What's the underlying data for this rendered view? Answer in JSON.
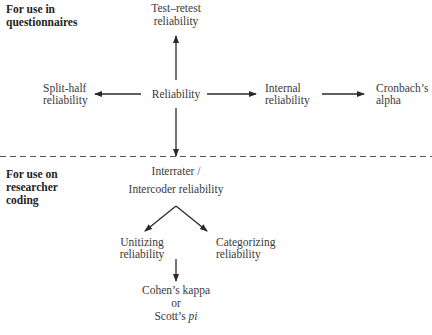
{
  "sections": {
    "top": {
      "line1": "For use in",
      "line2": "questionnaires"
    },
    "bottom": {
      "line1": "For use on",
      "line2": "researcher",
      "line3": "coding"
    }
  },
  "nodes": {
    "reliability": {
      "label": "Reliability"
    },
    "test_retest": {
      "line1": "Test–retest",
      "line2": "reliability"
    },
    "split_half": {
      "line1": "Split-half",
      "line2": "reliability"
    },
    "internal": {
      "line1": "Internal",
      "line2": "reliability"
    },
    "cronbach": {
      "line1": "Cronbach’s",
      "line2": "alpha"
    },
    "interrater": {
      "line1": "Interrater /",
      "line2": "Intercoder reliability"
    },
    "unitizing": {
      "line1": "Unitizing",
      "line2": "reliability"
    },
    "categorizing": {
      "line1": "Categorizing",
      "line2": "reliability"
    },
    "cohen": {
      "line1": "Cohen’s kappa",
      "line2": "or",
      "line3_prefix": "Scott’s ",
      "line3_italic": "pi"
    }
  },
  "colors": {
    "text": "#3a3a3a",
    "arrow": "#2a2a2a",
    "divider": "#555555"
  }
}
